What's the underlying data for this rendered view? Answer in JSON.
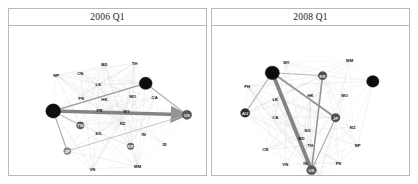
{
  "figure": {
    "type": "network-graph-facets",
    "background": "#ffffff",
    "panel_border": "#b9b9b9",
    "strip_background": "#ffffff"
  },
  "panels": [
    {
      "id": "panel-2006q1",
      "title": "2006 Q1",
      "nodes": [
        {
          "id": "NP",
          "label": "NP",
          "x": 47,
          "y": 51,
          "r": 0,
          "fill": "none",
          "label_pos": "above"
        },
        {
          "id": "CN",
          "label": "CN",
          "x": 71,
          "y": 49,
          "r": 0,
          "fill": "none",
          "label_pos": "above"
        },
        {
          "id": "BD",
          "label": "BD",
          "x": 95,
          "y": 40,
          "r": 0,
          "fill": "none",
          "label_pos": "above"
        },
        {
          "id": "TH",
          "label": "TH",
          "x": 125,
          "y": 39,
          "r": 0,
          "fill": "none",
          "label_pos": "above"
        },
        {
          "id": "LK",
          "label": "LK",
          "x": 89,
          "y": 61,
          "r": 0,
          "fill": "none",
          "label_pos": "above"
        },
        {
          "id": "PK",
          "label": "PK",
          "x": 72,
          "y": 75,
          "r": 0,
          "fill": "none",
          "label_pos": "above"
        },
        {
          "id": "HK",
          "label": "HK",
          "x": 95,
          "y": 76,
          "r": 0,
          "fill": "none",
          "label_pos": "above"
        },
        {
          "id": "MO",
          "label": "MO",
          "x": 123,
          "y": 73,
          "r": 0,
          "fill": "none",
          "label_pos": "above"
        },
        {
          "id": "CA",
          "label": "CA",
          "x": 145,
          "y": 74,
          "r": 0,
          "fill": "none",
          "label_pos": "above"
        },
        {
          "id": "MY",
          "label": "MY",
          "x": 117,
          "y": 89,
          "r": 0,
          "fill": "none",
          "label_pos": "above"
        },
        {
          "id": "FR",
          "label": "FR",
          "x": 90,
          "y": 88,
          "r": 0,
          "fill": "none",
          "label_pos": "above"
        },
        {
          "id": "NZ",
          "label": "NZ",
          "x": 113,
          "y": 102,
          "r": 0,
          "fill": "none",
          "label_pos": "above"
        },
        {
          "id": "SG",
          "label": "SG",
          "x": 89,
          "y": 112,
          "r": 0,
          "fill": "none",
          "label_pos": "above"
        },
        {
          "id": "IN",
          "label": "IN",
          "x": 134,
          "y": 113,
          "r": 0,
          "fill": "none",
          "label_pos": "above"
        },
        {
          "id": "ID",
          "label": "ID",
          "x": 155,
          "y": 124,
          "r": 0,
          "fill": "none",
          "label_pos": "above"
        },
        {
          "id": "MM",
          "label": "MM",
          "x": 128,
          "y": 147,
          "r": 0,
          "fill": "none",
          "label_pos": "above"
        },
        {
          "id": "VN",
          "label": "VN",
          "x": 83,
          "y": 150,
          "r": 0,
          "fill": "none",
          "label_pos": "above"
        },
        {
          "id": "DE",
          "label": "",
          "x": 44,
          "y": 89,
          "r": 7.5,
          "fill": "#0d0d0d",
          "label_pos": "in"
        },
        {
          "id": "GB",
          "label": "",
          "x": 136,
          "y": 60,
          "r": 6.5,
          "fill": "#0d0d0d",
          "label_pos": "in"
        },
        {
          "id": "US",
          "label": "US",
          "x": 177,
          "y": 93,
          "r": 4.8,
          "fill": "#595959",
          "label_pos": "in"
        },
        {
          "id": "TW",
          "label": "TW",
          "x": 71,
          "y": 104,
          "r": 3.8,
          "fill": "#5e5e5e",
          "label_pos": "in"
        },
        {
          "id": "JP",
          "label": "JP",
          "x": 58,
          "y": 131,
          "r": 3.6,
          "fill": "#8f8f8f",
          "label_pos": "in"
        },
        {
          "id": "KR",
          "label": "KR",
          "x": 121,
          "y": 126,
          "r": 3.4,
          "fill": "#6b6b6b",
          "label_pos": "in"
        }
      ],
      "strong_edges": [
        {
          "from": "DE",
          "to": "US",
          "width": 3.6,
          "color": "#7a7a7a",
          "arrow": true
        },
        {
          "from": "DE",
          "to": "GB",
          "width": 1.4,
          "color": "#9a9a9a",
          "arrow": false
        },
        {
          "from": "DE",
          "to": "JP",
          "width": 1.1,
          "color": "#9e9e9e",
          "arrow": false
        },
        {
          "from": "GB",
          "to": "US",
          "width": 1.2,
          "color": "#a5a5a5",
          "arrow": false
        },
        {
          "from": "DE",
          "to": "TW",
          "width": 0.9,
          "color": "#a8a8a8",
          "arrow": false
        },
        {
          "from": "JP",
          "to": "US",
          "width": 0.8,
          "color": "#b0b0b0",
          "arrow": false
        }
      ]
    },
    {
      "id": "panel-2008q1",
      "title": "2008 Q1",
      "nodes": [
        {
          "id": "MY",
          "label": "MY",
          "x": 74,
          "y": 38,
          "r": 0,
          "fill": "none",
          "label_pos": "above"
        },
        {
          "id": "MM",
          "label": "MM",
          "x": 137,
          "y": 36,
          "r": 0,
          "fill": "none",
          "label_pos": "above"
        },
        {
          "id": "PH",
          "label": "PH",
          "x": 35,
          "y": 63,
          "r": 0,
          "fill": "none",
          "label_pos": "above"
        },
        {
          "id": "LK",
          "label": "LK",
          "x": 63,
          "y": 76,
          "r": 0,
          "fill": "none",
          "label_pos": "above"
        },
        {
          "id": "HK",
          "label": "HK",
          "x": 98,
          "y": 72,
          "r": 0,
          "fill": "none",
          "label_pos": "above"
        },
        {
          "id": "MO",
          "label": "MO",
          "x": 132,
          "y": 72,
          "r": 0,
          "fill": "none",
          "label_pos": "above"
        },
        {
          "id": "CA",
          "label": "CA",
          "x": 63,
          "y": 95,
          "r": 0,
          "fill": "none",
          "label_pos": "above"
        },
        {
          "id": "SG",
          "label": "SG",
          "x": 95,
          "y": 109,
          "r": 0,
          "fill": "none",
          "label_pos": "above"
        },
        {
          "id": "NZ",
          "label": "NZ",
          "x": 140,
          "y": 106,
          "r": 0,
          "fill": "none",
          "label_pos": "above"
        },
        {
          "id": "BD",
          "label": "BD",
          "x": 89,
          "y": 117,
          "r": 0,
          "fill": "none",
          "label_pos": "above"
        },
        {
          "id": "TH",
          "label": "TH",
          "x": 98,
          "y": 125,
          "r": 0,
          "fill": "none",
          "label_pos": "above"
        },
        {
          "id": "CN",
          "label": "CN",
          "x": 53,
          "y": 129,
          "r": 0,
          "fill": "none",
          "label_pos": "above"
        },
        {
          "id": "NP",
          "label": "NP",
          "x": 145,
          "y": 125,
          "r": 0,
          "fill": "none",
          "label_pos": "above"
        },
        {
          "id": "VN",
          "label": "VN",
          "x": 73,
          "y": 145,
          "r": 0,
          "fill": "none",
          "label_pos": "above"
        },
        {
          "id": "IN",
          "label": "IN",
          "x": 93,
          "y": 143,
          "r": 0,
          "fill": "none",
          "label_pos": "above"
        },
        {
          "id": "PK",
          "label": "PK",
          "x": 126,
          "y": 143,
          "r": 0,
          "fill": "none",
          "label_pos": "above"
        },
        {
          "id": "ID",
          "label": "ID",
          "x": 107,
          "y": 157,
          "r": 0,
          "fill": "none",
          "label_pos": "above"
        },
        {
          "id": "DE",
          "label": "",
          "x": 60,
          "y": 49,
          "r": 7.2,
          "fill": "#0d0d0d",
          "label_pos": "in"
        },
        {
          "id": "FR",
          "label": "",
          "x": 160,
          "y": 58,
          "r": 6.2,
          "fill": "#0d0d0d",
          "label_pos": "in"
        },
        {
          "id": "KR",
          "label": "KR",
          "x": 110,
          "y": 52,
          "r": 4.3,
          "fill": "#4c4c4c",
          "label_pos": "in"
        },
        {
          "id": "AU",
          "label": "AU",
          "x": 33,
          "y": 91,
          "r": 4.6,
          "fill": "#2b2b2b",
          "label_pos": "in"
        },
        {
          "id": "JP",
          "label": "JP",
          "x": 123,
          "y": 96,
          "r": 4.4,
          "fill": "#4f4f4f",
          "label_pos": "in"
        },
        {
          "id": "US",
          "label": "US",
          "x": 99,
          "y": 151,
          "r": 4.8,
          "fill": "#585858",
          "label_pos": "in"
        }
      ],
      "strong_edges": [
        {
          "from": "DE",
          "to": "US",
          "width": 3.8,
          "color": "#7a7a7a",
          "arrow": false
        },
        {
          "from": "DE",
          "to": "JP",
          "width": 1.8,
          "color": "#8e8e8e",
          "arrow": false
        },
        {
          "from": "KR",
          "to": "US",
          "width": 1.5,
          "color": "#8a8a8a",
          "arrow": false
        },
        {
          "from": "DE",
          "to": "AU",
          "width": 1.0,
          "color": "#a3a3a3",
          "arrow": false
        },
        {
          "from": "JP",
          "to": "US",
          "width": 1.0,
          "color": "#a0a0a0",
          "arrow": false
        },
        {
          "from": "DE",
          "to": "KR",
          "width": 0.9,
          "color": "#aaaaaa",
          "arrow": false
        }
      ]
    }
  ]
}
